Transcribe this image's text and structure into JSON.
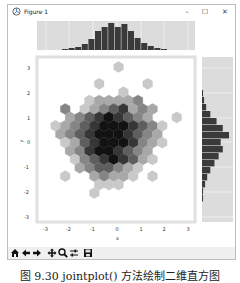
{
  "window": {
    "title": "Figure 1",
    "minimize_label": "–",
    "maximize_label": "☐",
    "close_label": "✕"
  },
  "toolbar": {
    "buttons": [
      {
        "name": "home",
        "icon": "home-icon"
      },
      {
        "name": "back",
        "icon": "arrow-left-icon"
      },
      {
        "name": "forward",
        "icon": "arrow-right-icon"
      },
      {
        "name": "pan",
        "icon": "move-icon"
      },
      {
        "name": "zoom",
        "icon": "magnifier-icon"
      },
      {
        "name": "configure-subplots",
        "icon": "sliders-icon"
      },
      {
        "name": "save",
        "icon": "floppy-icon"
      }
    ]
  },
  "caption": "图 9.30 jointplot() 方法绘制二维直方图",
  "chart_data": {
    "type": "hexbin-jointplot",
    "xlabel": "x",
    "ylabel": "y",
    "xticks": [
      "-3",
      "-2",
      "-1",
      "0",
      "1",
      "2",
      "3"
    ],
    "yticks": [
      "3",
      "2",
      "1",
      "0",
      "-1",
      "-2",
      "-3"
    ],
    "xlim": [
      -3.4,
      3.3
    ],
    "ylim": [
      -3.2,
      3.5
    ],
    "colormap": "grays",
    "top_hist": {
      "bins": 16,
      "heights": [
        1,
        2,
        3,
        6,
        11,
        19,
        23,
        27,
        23,
        26,
        19,
        12,
        7,
        4,
        2,
        1
      ],
      "color": "#3a3a3a",
      "bg": "#dcdcdc"
    },
    "right_hist": {
      "bins": 16,
      "widths": [
        1,
        2,
        4,
        8,
        14,
        20,
        26,
        18,
        20,
        16,
        12,
        8,
        5,
        3,
        1,
        1
      ],
      "color": "#3a3a3a",
      "bg": "#dcdcdc"
    },
    "hex_cells": [
      [
        8,
        0,
        1
      ],
      [
        6,
        2,
        1
      ],
      [
        11,
        2,
        1
      ],
      [
        8,
        3,
        1
      ],
      [
        5,
        4,
        1
      ],
      [
        6,
        4,
        2
      ],
      [
        7,
        4,
        2
      ],
      [
        8,
        4,
        2
      ],
      [
        9,
        4,
        2
      ],
      [
        10,
        4,
        3
      ],
      [
        2,
        5,
        3
      ],
      [
        4,
        5,
        1
      ],
      [
        5,
        5,
        2
      ],
      [
        6,
        5,
        3
      ],
      [
        7,
        5,
        4
      ],
      [
        8,
        5,
        5
      ],
      [
        9,
        5,
        2
      ],
      [
        10,
        5,
        3
      ],
      [
        11,
        5,
        2
      ],
      [
        3,
        6,
        2
      ],
      [
        4,
        6,
        3
      ],
      [
        5,
        6,
        4
      ],
      [
        6,
        6,
        5
      ],
      [
        7,
        6,
        6
      ],
      [
        8,
        6,
        5
      ],
      [
        9,
        6,
        4
      ],
      [
        10,
        6,
        3
      ],
      [
        11,
        6,
        2
      ],
      [
        14,
        6,
        1
      ],
      [
        1,
        7,
        1
      ],
      [
        2,
        7,
        2
      ],
      [
        3,
        7,
        3
      ],
      [
        4,
        7,
        4
      ],
      [
        5,
        7,
        5
      ],
      [
        6,
        7,
        6
      ],
      [
        7,
        7,
        6
      ],
      [
        8,
        7,
        6
      ],
      [
        9,
        7,
        5
      ],
      [
        10,
        7,
        4
      ],
      [
        11,
        7,
        3
      ],
      [
        12,
        7,
        1
      ],
      [
        2,
        8,
        2
      ],
      [
        3,
        8,
        3
      ],
      [
        4,
        8,
        4
      ],
      [
        5,
        8,
        5
      ],
      [
        6,
        8,
        6
      ],
      [
        7,
        8,
        6
      ],
      [
        8,
        8,
        6
      ],
      [
        9,
        8,
        5
      ],
      [
        10,
        8,
        4
      ],
      [
        11,
        8,
        3
      ],
      [
        12,
        8,
        2
      ],
      [
        2,
        9,
        1
      ],
      [
        3,
        9,
        2
      ],
      [
        4,
        9,
        4
      ],
      [
        5,
        9,
        5
      ],
      [
        6,
        9,
        6
      ],
      [
        7,
        9,
        6
      ],
      [
        8,
        9,
        6
      ],
      [
        9,
        9,
        5
      ],
      [
        10,
        9,
        3
      ],
      [
        11,
        9,
        2
      ],
      [
        12,
        9,
        1
      ],
      [
        3,
        10,
        2
      ],
      [
        4,
        10,
        3
      ],
      [
        5,
        10,
        5
      ],
      [
        6,
        10,
        6
      ],
      [
        7,
        10,
        6
      ],
      [
        8,
        10,
        5
      ],
      [
        9,
        10,
        4
      ],
      [
        10,
        10,
        3
      ],
      [
        11,
        10,
        2
      ],
      [
        3,
        11,
        1
      ],
      [
        4,
        11,
        3
      ],
      [
        5,
        11,
        4
      ],
      [
        6,
        11,
        5
      ],
      [
        7,
        11,
        6
      ],
      [
        8,
        11,
        5
      ],
      [
        9,
        11,
        4
      ],
      [
        10,
        11,
        2
      ],
      [
        11,
        11,
        1
      ],
      [
        4,
        12,
        2
      ],
      [
        5,
        12,
        3
      ],
      [
        6,
        12,
        4
      ],
      [
        7,
        12,
        4
      ],
      [
        8,
        12,
        3
      ],
      [
        9,
        12,
        2
      ],
      [
        10,
        12,
        1
      ],
      [
        2,
        13,
        1
      ],
      [
        5,
        13,
        2
      ],
      [
        6,
        13,
        3
      ],
      [
        7,
        13,
        2
      ],
      [
        8,
        13,
        2
      ],
      [
        9,
        13,
        1
      ],
      [
        11,
        13,
        1
      ],
      [
        6,
        14,
        1
      ],
      [
        7,
        14,
        1
      ],
      [
        8,
        14,
        1
      ],
      [
        5,
        15,
        1
      ]
    ]
  }
}
